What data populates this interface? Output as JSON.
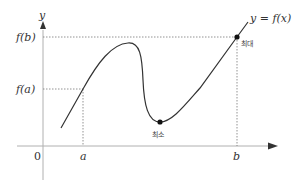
{
  "diagram": {
    "axes": {
      "y_label": "y",
      "origin_label": "0"
    },
    "x_ticks": [
      {
        "label": "a"
      },
      {
        "label": "b"
      }
    ],
    "y_ticks": [
      {
        "label": "f(b)"
      },
      {
        "label": "f(a)"
      }
    ],
    "curve_label": "y = f(x)",
    "points": {
      "max_label": "최대",
      "min_label": "최소"
    },
    "colors": {
      "curve": "#333333",
      "axis": "#999999",
      "guide": "#777777",
      "point": "#111111"
    }
  }
}
